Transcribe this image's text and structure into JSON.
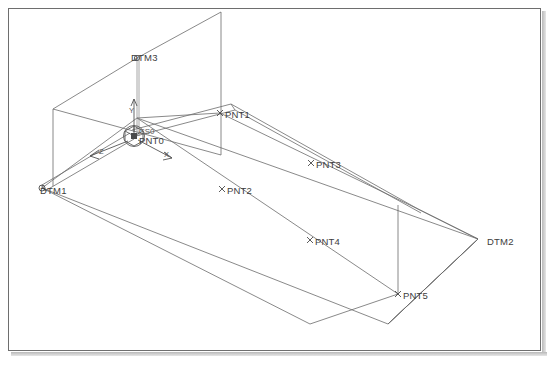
{
  "app": {
    "title": "CAD Wireframe Viewport",
    "background_color": "#ffffff",
    "frame_color": "#6e6e6e",
    "line_color": "#6b6b6b",
    "label_color": "#3d3d3d"
  },
  "view": {
    "projection": "isometric",
    "width": 552,
    "height": 365
  },
  "datum_planes": [
    {
      "name": "DTM3",
      "label": "DTM3",
      "type": "vertical-plane",
      "label_x": 131,
      "label_y": 57,
      "vertex_x": 137,
      "vertex_y": 58,
      "outline": "137,58 221,12 221,155 53,109 53,109"
    },
    {
      "name": "DTM1",
      "label": "DTM1",
      "type": "plane-corner",
      "label_x": 40,
      "label_y": 192,
      "vertex_x": 42,
      "vertex_y": 188
    },
    {
      "name": "DTM2",
      "label": "DTM2",
      "type": "plane-corner",
      "label_x": 487,
      "label_y": 243,
      "vertex_x": 478,
      "vertex_y": 239
    }
  ],
  "points": [
    {
      "name": "PNT0",
      "label": "PNT0",
      "marker_x": 134,
      "marker_y": 136,
      "label_x": 139,
      "label_y": 142,
      "marker": "x"
    },
    {
      "name": "PNT1",
      "label": "PNT1",
      "marker_x": 220,
      "marker_y": 113,
      "label_x": 225,
      "label_y": 117,
      "marker": "x"
    },
    {
      "name": "PNT2",
      "label": "PNT2",
      "marker_x": 222,
      "marker_y": 189,
      "label_x": 227,
      "label_y": 193,
      "marker": "x"
    },
    {
      "name": "PNT3",
      "label": "PNT3",
      "marker_x": 311,
      "marker_y": 163,
      "label_x": 316,
      "label_y": 167,
      "marker": "x"
    },
    {
      "name": "PNT4",
      "label": "PNT4",
      "marker_x": 310,
      "marker_y": 240,
      "label_x": 315,
      "label_y": 244,
      "marker": "x"
    },
    {
      "name": "PNT5",
      "label": "PNT5",
      "marker_x": 398,
      "marker_y": 294,
      "label_x": 402,
      "label_y": 298,
      "marker": "x"
    }
  ],
  "coordinate_system": {
    "name": "CS0",
    "label": "CS0",
    "origin_x": 134,
    "origin_y": 136,
    "label_x": 140,
    "label_y": 133,
    "axes": [
      {
        "name": "Y",
        "label": "Y",
        "label_x": 130,
        "label_y": 110,
        "tip_x": 135,
        "tip_y": 100
      },
      {
        "name": "X",
        "label": "X",
        "label_x": 164,
        "label_y": 155,
        "tip_x": 170,
        "tip_y": 157
      },
      {
        "name": "Z",
        "label": "Z",
        "label_x": 101,
        "label_y": 157,
        "tip_x": 92,
        "tip_y": 156
      }
    ]
  },
  "geometry": {
    "base_quad": "42,188 137,118 478,239 388,324",
    "inner_quad": "137,118 220,113 398,294 310,324",
    "top_rail_upper": "134,131 231,105 418,209",
    "top_rail_lower": "137,136 234,110 421,213",
    "left_rail_upper": "42,185 131,134",
    "left_rail_lower": "45,190 134,139",
    "vertical_edge_pnt5": "398,205 398,294",
    "vertical_edge_dtm3": "137,58 137,136",
    "plane_dtm3": "137,58 221,12 221,155 53,109",
    "right_band_top": "137,118 220,113 418,209 398,205",
    "right_band_bottom": "42,188 137,118 398,294 310,324"
  }
}
